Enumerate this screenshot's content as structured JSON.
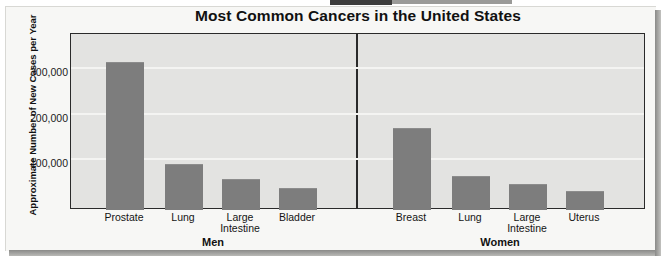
{
  "chart_data": {
    "type": "bar",
    "title": "Most Common Cancers in the United States",
    "xlabel": "",
    "ylabel": "Approximate Number of New Cases per Year",
    "ylim": [
      0,
      390000
    ],
    "yticks": [
      100000,
      200000,
      300000
    ],
    "ytick_labels": [
      "100,000",
      "200,000",
      "300,000"
    ],
    "grid": true,
    "legend": "none",
    "groups": [
      {
        "name": "Men",
        "categories": [
          "Prostate",
          "Lung",
          "Large Intestine",
          "Bladder"
        ],
        "values": [
          323000,
          98000,
          66000,
          47000
        ]
      },
      {
        "name": "Women",
        "categories": [
          "Breast",
          "Lung",
          "Large Intestine",
          "Uterus"
        ],
        "values": [
          177000,
          73000,
          55000,
          40000
        ]
      }
    ],
    "bar_color": "#7d7d7d",
    "plot_background": "#e3e3e1",
    "axis_color": "#2a2a2a"
  },
  "bars": [
    {
      "label": "Prostate",
      "label_lines": "Prostate",
      "value": 323000,
      "x": 35,
      "width": 38,
      "group": "Men"
    },
    {
      "label": "Lung",
      "label_lines": "Lung",
      "value": 98000,
      "x": 94,
      "width": 38,
      "group": "Men"
    },
    {
      "label": "Large Intestine",
      "label_lines": "Large\nIntestine",
      "value": 66000,
      "x": 151,
      "width": 38,
      "group": "Men"
    },
    {
      "label": "Bladder",
      "label_lines": "Bladder",
      "value": 47000,
      "x": 208,
      "width": 38,
      "group": "Men"
    },
    {
      "label": "Breast",
      "label_lines": "Breast",
      "value": 177000,
      "x": 322,
      "width": 38,
      "group": "Women"
    },
    {
      "label": "Lung",
      "label_lines": "Lung",
      "value": 73000,
      "x": 381,
      "width": 38,
      "group": "Women"
    },
    {
      "label": "Large Intestine",
      "label_lines": "Large\nIntestine",
      "value": 55000,
      "x": 438,
      "width": 38,
      "group": "Women"
    },
    {
      "label": "Uterus",
      "label_lines": "Uterus",
      "value": 40000,
      "x": 495,
      "width": 38,
      "group": "Women"
    }
  ],
  "group_labels": [
    {
      "name": "Men",
      "center_x": 213
    },
    {
      "name": "Women",
      "center_x": 500
    }
  ],
  "yticks_px": [
    {
      "label": "300,000",
      "y": 66
    },
    {
      "label": "200,000",
      "y": 112
    },
    {
      "label": "100,000",
      "y": 157
    }
  ]
}
